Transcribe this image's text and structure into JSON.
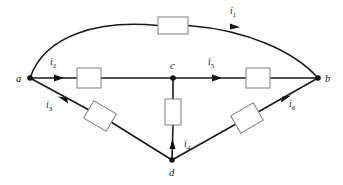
{
  "diagram": {
    "type": "electrical-circuit-schematic",
    "background_color": "#ffffff",
    "wire_color": "#1a1a1a",
    "resistor_fill": "#ffffff",
    "resistor_stroke": "#8a8a8a",
    "nodes": [
      {
        "id": "a",
        "label": "a",
        "x": 30,
        "y": 78,
        "label_x": 18,
        "label_y": 82,
        "dot": true
      },
      {
        "id": "b",
        "label": "b",
        "x": 318,
        "y": 78,
        "label_x": 326,
        "label_y": 82,
        "dot": true
      },
      {
        "id": "c",
        "label": "c",
        "x": 173,
        "y": 78,
        "label_x": 170,
        "label_y": 69,
        "dot": true
      },
      {
        "id": "d",
        "label": "d",
        "x": 172,
        "y": 160,
        "label_x": 169,
        "label_y": 175,
        "dot": true
      }
    ],
    "branches": [
      {
        "id": "i1",
        "current_label": "i",
        "subscript": "1",
        "label_x": 230,
        "label_y": 14,
        "from": "a",
        "to": "b",
        "path": "arc-top",
        "resistor": {
          "x": 158,
          "y": 17,
          "w": 30,
          "h": 17,
          "rotation": 0
        },
        "arrow_direction": "right"
      },
      {
        "id": "i2",
        "current_label": "i",
        "subscript": "2",
        "label_x": 52,
        "label_y": 65,
        "from": "a",
        "to": "c",
        "path": "horizontal",
        "resistor": {
          "x": 77,
          "y": 68,
          "w": 24,
          "h": 20,
          "rotation": 0
        },
        "arrow_direction": "right"
      },
      {
        "id": "i3",
        "current_label": "i",
        "subscript": "3",
        "label_x": 48,
        "label_y": 108,
        "from": "d",
        "to": "a",
        "path": "diagonal-lower-left",
        "resistor": {
          "x": 100,
          "y": 117,
          "w": 26,
          "h": 20,
          "rotation": 33
        },
        "arrow_direction": "up-left"
      },
      {
        "id": "i4",
        "current_label": "i",
        "subscript": "4",
        "label_x": 188,
        "label_y": 147,
        "from": "d",
        "to": "c",
        "path": "vertical",
        "resistor": {
          "x": 165,
          "y": 99,
          "w": 16,
          "h": 26,
          "rotation": 0
        },
        "arrow_direction": "up"
      },
      {
        "id": "i5",
        "current_label": "i",
        "subscript": "5",
        "label_x": 210,
        "label_y": 65,
        "from": "c",
        "to": "b",
        "path": "horizontal",
        "resistor": {
          "x": 246,
          "y": 68,
          "w": 24,
          "h": 20,
          "rotation": 0
        },
        "arrow_direction": "right"
      },
      {
        "id": "i6",
        "current_label": "i",
        "subscript": "6",
        "label_x": 291,
        "label_y": 107,
        "from": "d",
        "to": "b",
        "path": "diagonal-lower-right",
        "resistor": {
          "x": 247,
          "y": 118,
          "w": 26,
          "h": 20,
          "rotation": -33
        },
        "arrow_direction": "up-right"
      }
    ]
  }
}
